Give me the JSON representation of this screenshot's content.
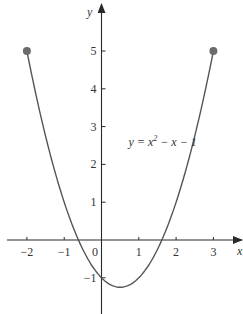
{
  "chart_data": {
    "type": "line",
    "title": "",
    "xlabel": "x",
    "ylabel": "y",
    "function": "y = x^2 - x - 1",
    "annotation": {
      "text_parts": [
        "y = x",
        "2",
        " − x − 1"
      ],
      "x": 1.1,
      "y": 2.55
    },
    "domain": [
      -2,
      3
    ],
    "xlim": [
      -2.55,
      3.8
    ],
    "ylim": [
      -1.95,
      6.2
    ],
    "x_ticks": [
      -2,
      -1,
      1,
      2,
      3
    ],
    "x_tick_labels": [
      "−2",
      "−1",
      "1",
      "2",
      "3"
    ],
    "y_ticks": [
      1,
      2,
      3,
      4,
      5,
      -1
    ],
    "y_tick_labels": [
      "1",
      "2",
      "3",
      "4",
      "5",
      "−1"
    ],
    "origin_label": "0",
    "grid": false,
    "legend": null,
    "series": [
      {
        "name": "y = x² − x − 1",
        "x": [
          -2,
          -1.5,
          -1,
          -0.5,
          0,
          0.5,
          1,
          1.5,
          2,
          2.5,
          3
        ],
        "values": [
          5,
          2.75,
          1,
          -0.25,
          -1,
          -1.25,
          -1,
          -0.25,
          1,
          2.75,
          5
        ]
      }
    ],
    "endpoints": [
      {
        "x": -2,
        "y": 5,
        "style": "closed"
      },
      {
        "x": 3,
        "y": 5,
        "style": "closed"
      }
    ],
    "colors": {
      "curve": "#555555",
      "axes": "#2a2a2a",
      "endpoints": "#6b6b6b",
      "text": "#333333"
    }
  }
}
